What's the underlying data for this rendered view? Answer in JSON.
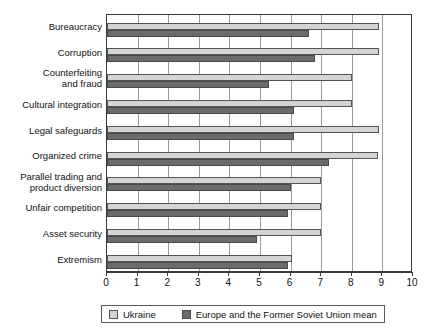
{
  "chart_data": {
    "type": "bar",
    "orientation": "horizontal",
    "title": "",
    "xlabel": "",
    "ylabel": "",
    "xlim": [
      0,
      10
    ],
    "xticks": [
      "0",
      "1",
      "2",
      "3",
      "4",
      "5",
      "6",
      "7",
      "8",
      "9",
      "10"
    ],
    "grid": true,
    "legend_position": "bottom",
    "categories": [
      "Bureaucracy",
      "Corruption",
      "Counterfeiting\nand fraud",
      "Cultural integration",
      "Legal safeguards",
      "Organized crime",
      "Parallel trading and\nproduct diversion",
      "Unfair competition",
      "Asset security",
      "Extremism"
    ],
    "series": [
      {
        "name": "Ukraine",
        "color": "#d4d4d4",
        "values": [
          8.9,
          8.9,
          8.0,
          8.0,
          8.9,
          8.85,
          7.0,
          7.0,
          7.0,
          6.05
        ]
      },
      {
        "name": "Europe and the Former Soviet Union mean",
        "color": "#6b6b6b",
        "values": [
          6.6,
          6.8,
          5.3,
          6.1,
          6.1,
          7.25,
          6.0,
          5.9,
          4.9,
          5.9
        ]
      }
    ]
  }
}
